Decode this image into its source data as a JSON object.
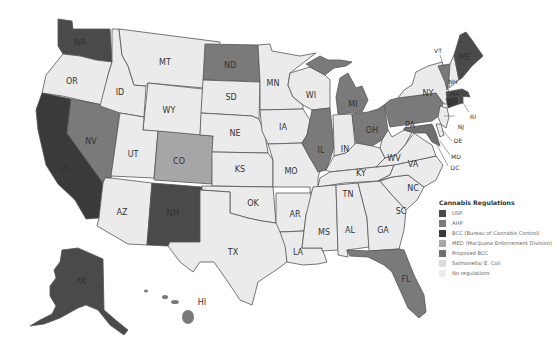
{
  "map": {
    "title": "Cannabis Regulations",
    "colors": {
      "USP": "#4a4a4a",
      "AHP": "#7a7a7a",
      "BCC": "#3a3a3a",
      "MED": "#a6a6a6",
      "ProposedBCC": "#6f6f6f",
      "Salmonella": "#e2e2e2",
      "None": "#ebebeb"
    },
    "legend": {
      "title": "Cannabis Regulations",
      "items": [
        {
          "label": "USP",
          "color": "#4a4a4a"
        },
        {
          "label": "AHP",
          "color": "#7a7a7a"
        },
        {
          "label": "BCC (Bureau of Cannabis Control)",
          "color": "#3a3a3a"
        },
        {
          "label": "MED (Marijuana Enforcement Division)",
          "color": "#a6a6a6"
        },
        {
          "label": "Proposed BCC",
          "color": "#6f6f6f"
        },
        {
          "label": "Salmonella/ E. Coli",
          "color": "#dcdcdc"
        },
        {
          "label": "No regulations",
          "color": "#ececec"
        }
      ]
    },
    "states": {
      "WA": {
        "label": "WA",
        "category": "USP"
      },
      "OR": {
        "label": "OR",
        "category": "No regulations"
      },
      "CA": {
        "label": "CA",
        "category": "BCC"
      },
      "NV": {
        "label": "NV",
        "category": "AHP"
      },
      "ID": {
        "label": "ID",
        "category": "No regulations"
      },
      "MT": {
        "label": "MT",
        "category": "No regulations"
      },
      "WY": {
        "label": "WY",
        "category": "No regulations"
      },
      "UT": {
        "label": "UT",
        "category": "No regulations"
      },
      "CO": {
        "label": "CO",
        "category": "MED"
      },
      "AZ": {
        "label": "AZ",
        "category": "No regulations"
      },
      "NM": {
        "label": "NM",
        "category": "USP"
      },
      "ND": {
        "label": "ND",
        "category": "AHP"
      },
      "SD": {
        "label": "SD",
        "category": "No regulations"
      },
      "NE": {
        "label": "NE",
        "category": "No regulations"
      },
      "KS": {
        "label": "KS",
        "category": "No regulations"
      },
      "OK": {
        "label": "OK",
        "category": "No regulations"
      },
      "TX": {
        "label": "TX",
        "category": "No regulations"
      },
      "MN": {
        "label": "MN",
        "category": "No regulations"
      },
      "IA": {
        "label": "IA",
        "category": "No regulations"
      },
      "MO": {
        "label": "MO",
        "category": "No regulations"
      },
      "AR": {
        "label": "AR",
        "category": "No regulations"
      },
      "LA": {
        "label": "LA",
        "category": "No regulations"
      },
      "WI": {
        "label": "WI",
        "category": "No regulations"
      },
      "IL": {
        "label": "IL",
        "category": "AHP"
      },
      "MI": {
        "label": "MI",
        "category": "AHP"
      },
      "IN": {
        "label": "IN",
        "category": "No regulations"
      },
      "OH": {
        "label": "OH",
        "category": "AHP"
      },
      "KY": {
        "label": "KY",
        "category": "No regulations"
      },
      "TN": {
        "label": "TN",
        "category": "No regulations"
      },
      "MS": {
        "label": "MS",
        "category": "No regulations"
      },
      "AL": {
        "label": "AL",
        "category": "No regulations"
      },
      "GA": {
        "label": "GA",
        "category": "No regulations"
      },
      "FL": {
        "label": "FL",
        "category": "AHP"
      },
      "SC": {
        "label": "SC",
        "category": "No regulations"
      },
      "NC": {
        "label": "NC",
        "category": "No regulations"
      },
      "VA": {
        "label": "VA",
        "category": "No regulations"
      },
      "WV": {
        "label": "WV",
        "category": "No regulations"
      },
      "PA": {
        "label": "PA",
        "category": "AHP"
      },
      "NY": {
        "label": "NY",
        "category": "No regulations"
      },
      "VT": {
        "label": "VT",
        "category": "AHP"
      },
      "NH": {
        "label": "NH",
        "category": "No regulations"
      },
      "ME": {
        "label": "ME",
        "category": "USP"
      },
      "MA": {
        "label": "MA",
        "category": "USP"
      },
      "CT": {
        "label": "CT",
        "category": "BCC"
      },
      "RI": {
        "label": "RI",
        "category": "USP"
      },
      "NJ": {
        "label": "NJ",
        "category": "No regulations"
      },
      "DE": {
        "label": "DE",
        "category": "No regulations"
      },
      "MD": {
        "label": "MD",
        "category": "AHP"
      },
      "DC": {
        "label": "DC",
        "category": "No regulations"
      },
      "AK": {
        "label": "AK",
        "category": "USP"
      },
      "HI": {
        "label": "HI",
        "category": "AHP"
      }
    }
  }
}
